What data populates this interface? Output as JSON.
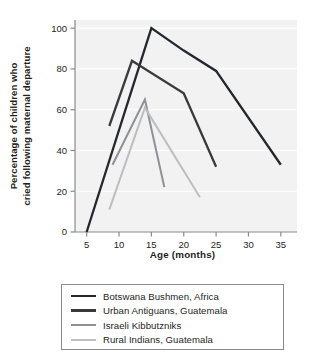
{
  "chart_data": {
    "type": "line",
    "title": "",
    "subtitle": "",
    "xlabel": "Age (months)",
    "ylabel": "Percentage of children who cried following maternal departure",
    "ylabel_lines": [
      "Percentage of children who",
      "cried following maternal departure"
    ],
    "xlim": [
      3.2,
      37.5
    ],
    "ylim": [
      0,
      104
    ],
    "xticks": [
      5,
      10,
      15,
      20,
      25,
      30,
      35
    ],
    "xtick_labels": [
      "5",
      "10",
      "15",
      "20",
      "25",
      "30",
      "35"
    ],
    "yticks": [
      0,
      20,
      40,
      60,
      80,
      100
    ],
    "ytick_labels": [
      "0",
      "20",
      "40",
      "60",
      "80",
      "100"
    ],
    "grid": true,
    "grid_color": "#ffffff",
    "plot_background": "#f2f2f2",
    "legend_position": "below-center",
    "series": [
      {
        "name": "Botswana Bushmen, Africa",
        "color": "#25272e",
        "width": 2.3,
        "x": [
          5,
          15,
          20,
          25,
          35
        ],
        "y": [
          0,
          100,
          89,
          79,
          33
        ]
      },
      {
        "name": "Urban Antiguans, Guatemala",
        "color": "#3a3a3c",
        "width": 2.3,
        "x": [
          8.5,
          12,
          20,
          25
        ],
        "y": [
          52,
          84,
          68,
          32
        ]
      },
      {
        "name": "Israeli Kibbutzniks",
        "color": "#8e9095",
        "width": 2.0,
        "x": [
          9,
          14,
          17
        ],
        "y": [
          33,
          65,
          22
        ]
      },
      {
        "name": "Rural Indians, Guatemala",
        "color": "#bcbec0",
        "width": 2.0,
        "x": [
          8.5,
          14,
          22.5
        ],
        "y": [
          11,
          61,
          17
        ]
      }
    ]
  },
  "legend": {
    "entries": [
      {
        "label": "Botswana Bushmen, Africa",
        "color": "#25272e",
        "width": 2.6
      },
      {
        "label": "Urban Antiguans, Guatemala",
        "color": "#3a3a3c",
        "width": 3.0
      },
      {
        "label": "Israeli Kibbutzniks",
        "color": "#8e9095",
        "width": 2.2
      },
      {
        "label": "Rural Indians, Guatemala",
        "color": "#bcbec0",
        "width": 2.2
      }
    ]
  }
}
